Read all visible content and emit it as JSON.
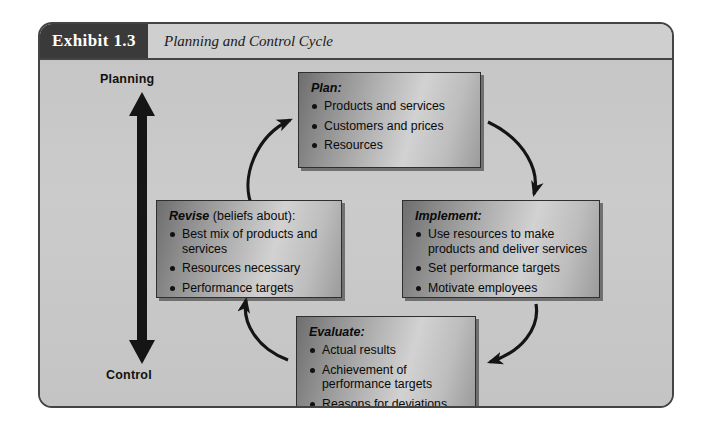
{
  "exhibit": {
    "tag": "Exhibit 1.3",
    "title": "Planning and Control Cycle"
  },
  "axis": {
    "top_label": "Planning",
    "bottom_label": "Control",
    "arrow_icon_top": "arrow-up-icon",
    "arrow_icon_bottom": "arrow-down-icon"
  },
  "boxes": {
    "plan": {
      "heading_strong": "Plan:",
      "heading_plain": "",
      "items": [
        "Products and services",
        "Customers and prices",
        "Resources"
      ]
    },
    "implement": {
      "heading_strong": "Implement:",
      "heading_plain": "",
      "items": [
        "Use resources to make products and deliver services",
        "Set performance targets",
        "Motivate employees"
      ]
    },
    "evaluate": {
      "heading_strong": "Evaluate:",
      "heading_plain": "",
      "items": [
        "Actual results",
        "Achievement of performance targets",
        "Reasons for deviations"
      ]
    },
    "revise": {
      "heading_strong": "Revise",
      "heading_plain": " (beliefs about):",
      "items": [
        "Best mix of products and services",
        "Resources necessary",
        "Performance targets"
      ]
    }
  },
  "arrows": {
    "revise_to_plan": "curved-arrow-revise-to-plan",
    "plan_to_implement": "curved-arrow-plan-to-implement",
    "implement_to_evaluate": "curved-arrow-implement-to-evaluate",
    "evaluate_to_revise": "curved-arrow-evaluate-to-revise"
  },
  "colors": {
    "frame_border": "#444444",
    "tag_background": "#3a3a3a",
    "canvas_background": "#c8c8c8",
    "box_gradient_dark": "#6e6e6e",
    "box_gradient_light": "#d2d2d2",
    "arrow_color": "#141414"
  }
}
